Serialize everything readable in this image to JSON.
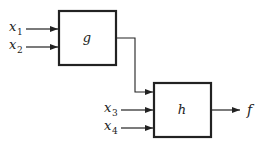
{
  "diagram": {
    "blocks": [
      {
        "id": "g",
        "label": "g"
      },
      {
        "id": "h",
        "label": "h"
      }
    ],
    "inputs": [
      {
        "name": "x",
        "sub": "1",
        "to": "g"
      },
      {
        "name": "x",
        "sub": "2",
        "to": "g"
      },
      {
        "name": "x",
        "sub": "3",
        "to": "h"
      },
      {
        "name": "x",
        "sub": "4",
        "to": "h"
      }
    ],
    "output": {
      "label": "f",
      "from": "h"
    },
    "connections": [
      {
        "from": "g",
        "to": "h"
      }
    ],
    "colors": {
      "stroke": "#222222",
      "background": "#ffffff"
    }
  }
}
